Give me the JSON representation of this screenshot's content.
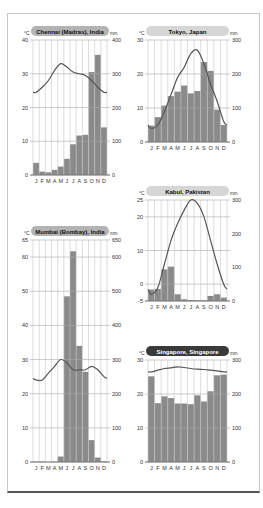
{
  "colors": {
    "bar": "#8a8a8a",
    "line": "#555555",
    "grid": "#c7c7c7",
    "badge_light": "#d6d6d6",
    "badge_medium": "#b3b3b3",
    "badge_dark": "#3a3a3a"
  },
  "months": [
    "J",
    "F",
    "M",
    "A",
    "M",
    "J",
    "J",
    "A",
    "S",
    "O",
    "N",
    "D"
  ],
  "chart_data": [
    {
      "id": "chennai",
      "type": "bar+line",
      "title": "Chennai (Madras), India",
      "badge_style": "medium",
      "left_unit": "°C",
      "right_unit": "mm",
      "temp_range": [
        0,
        40
      ],
      "precip_range": [
        0,
        400
      ],
      "left_ticks": [
        0,
        10,
        20,
        30,
        40
      ],
      "right_ticks": [
        0,
        100,
        200,
        300,
        400
      ],
      "categories": [
        "J",
        "F",
        "M",
        "A",
        "M",
        "J",
        "J",
        "A",
        "S",
        "O",
        "N",
        "D"
      ],
      "series": [
        {
          "name": "Precipitation (mm)",
          "kind": "bar",
          "values": [
            36,
            10,
            8,
            15,
            25,
            48,
            91,
            117,
            119,
            305,
            356,
            141
          ]
        },
        {
          "name": "Temperature (°C)",
          "kind": "line",
          "values": [
            24.5,
            26,
            28,
            31,
            33,
            32,
            30.5,
            30,
            29.5,
            28,
            26,
            24.5
          ]
        }
      ],
      "box": {
        "x": 33,
        "y": 40,
        "w": 74,
        "h": 135
      }
    },
    {
      "id": "tokyo",
      "type": "bar+line",
      "title": "Tokyo, Japan",
      "badge_style": "light",
      "left_unit": "°C",
      "right_unit": "mm",
      "temp_range": [
        0,
        30
      ],
      "precip_range": [
        0,
        300
      ],
      "left_ticks": [
        0,
        10,
        20,
        30
      ],
      "right_ticks": [
        0,
        100,
        200,
        300
      ],
      "categories": [
        "J",
        "F",
        "M",
        "A",
        "M",
        "J",
        "J",
        "A",
        "S",
        "O",
        "N",
        "D"
      ],
      "series": [
        {
          "name": "Precipitation (mm)",
          "kind": "bar",
          "values": [
            48,
            73,
            107,
            135,
            148,
            166,
            143,
            150,
            235,
            209,
            95,
            50
          ]
        },
        {
          "name": "Temperature (°C)",
          "kind": "line",
          "values": [
            4,
            5,
            9,
            14,
            19,
            22,
            26,
            27,
            23,
            17,
            12,
            6
          ]
        }
      ],
      "box": {
        "x": 148,
        "y": 40,
        "w": 79,
        "h": 102
      }
    },
    {
      "id": "kabul",
      "type": "bar+line",
      "title": "Kabul, Pakistan",
      "badge_style": "light",
      "left_unit": "°C",
      "right_unit": "mm",
      "temp_range": [
        -5,
        25
      ],
      "precip_range": [
        0,
        300
      ],
      "left_ticks": [
        -5,
        0,
        10,
        20,
        25
      ],
      "right_ticks": [
        0,
        100,
        200,
        300
      ],
      "categories": [
        "J",
        "F",
        "M",
        "A",
        "M",
        "J",
        "J",
        "A",
        "S",
        "O",
        "N",
        "D"
      ],
      "series": [
        {
          "name": "Precipitation (mm)",
          "kind": "bar",
          "values": [
            34,
            36,
            94,
            102,
            20,
            5,
            3,
            2,
            2,
            15,
            20,
            10
          ]
        },
        {
          "name": "Temperature (°C)",
          "kind": "line",
          "values": [
            -3,
            -1,
            6,
            13,
            18,
            22,
            25,
            24,
            20,
            13,
            6,
            0
          ]
        }
      ],
      "box": {
        "x": 148,
        "y": 200,
        "w": 79,
        "h": 101
      }
    },
    {
      "id": "mumbai",
      "type": "bar+line",
      "title": "Mumbai (Bombay), India",
      "badge_style": "medium",
      "left_unit": "°C",
      "right_unit": "mm",
      "temp_range": [
        0,
        65
      ],
      "precip_range": [
        0,
        650
      ],
      "left_ticks": [
        0,
        10,
        20,
        30,
        40,
        50,
        60,
        65
      ],
      "right_ticks": [
        0,
        100,
        200,
        300,
        400,
        500,
        600,
        650
      ],
      "categories": [
        "J",
        "F",
        "M",
        "A",
        "M",
        "J",
        "J",
        "A",
        "S",
        "O",
        "N",
        "D"
      ],
      "series": [
        {
          "name": "Precipitation (mm)",
          "kind": "bar",
          "values": [
            1,
            1,
            0,
            1,
            16,
            485,
            617,
            340,
            264,
            64,
            13,
            2
          ]
        },
        {
          "name": "Temperature (°C)",
          "kind": "line",
          "values": [
            24,
            24,
            26,
            28,
            30,
            29,
            27,
            27,
            27,
            28,
            27,
            25
          ]
        }
      ],
      "box": {
        "x": 33,
        "y": 240,
        "w": 74,
        "h": 222
      }
    },
    {
      "id": "singapore",
      "type": "bar+line",
      "title": "Singapore, Singapore",
      "badge_style": "dark",
      "left_unit": "°C",
      "right_unit": "mm",
      "temp_range": [
        0,
        30
      ],
      "precip_range": [
        0,
        300
      ],
      "left_ticks": [
        0,
        10,
        20,
        30
      ],
      "right_ticks": [
        0,
        100,
        200,
        300
      ],
      "categories": [
        "J",
        "F",
        "M",
        "A",
        "M",
        "J",
        "J",
        "A",
        "S",
        "O",
        "N",
        "D"
      ],
      "series": [
        {
          "name": "Precipitation (mm)",
          "kind": "bar",
          "values": [
            252,
            173,
            193,
            188,
            172,
            172,
            170,
            196,
            178,
            208,
            255,
            257
          ]
        },
        {
          "name": "Temperature (°C)",
          "kind": "line",
          "values": [
            26.5,
            27,
            27.5,
            27.7,
            28,
            27.8,
            27.5,
            27.3,
            27.2,
            27,
            26.8,
            26.5
          ]
        }
      ],
      "box": {
        "x": 148,
        "y": 360,
        "w": 79,
        "h": 102
      }
    }
  ]
}
